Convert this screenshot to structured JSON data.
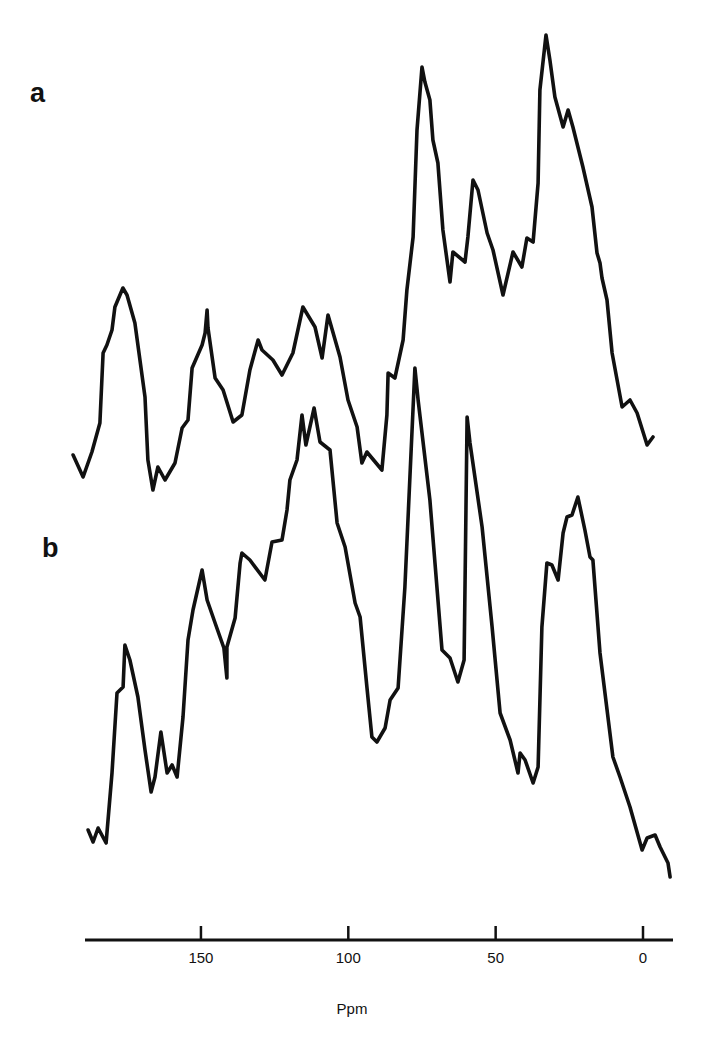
{
  "chart_data": {
    "type": "line",
    "title": "",
    "xlabel": "Ppm",
    "ylabel": "",
    "x_reversed": true,
    "xlim": [
      195,
      -10
    ],
    "xticks": [
      150,
      100,
      50,
      0
    ],
    "xtick_labels": [
      "150",
      "100",
      "50",
      "0"
    ],
    "grid": false,
    "legend": "none",
    "y_units": "relative intensity (arbitrary, pixel-scaled)",
    "series": [
      {
        "name": "a",
        "panel_label": "a",
        "baseline": 500,
        "points": [
          [
            193.4,
            45
          ],
          [
            190.0,
            23
          ],
          [
            187.0,
            48
          ],
          [
            184.3,
            77
          ],
          [
            183.2,
            147
          ],
          [
            181.9,
            155
          ],
          [
            180.2,
            170
          ],
          [
            179.2,
            193
          ],
          [
            176.5,
            212
          ],
          [
            175.1,
            205
          ],
          [
            172.4,
            177
          ],
          [
            169.0,
            103
          ],
          [
            168.0,
            40
          ],
          [
            166.3,
            10
          ],
          [
            164.6,
            33
          ],
          [
            162.2,
            20
          ],
          [
            158.8,
            37
          ],
          [
            156.4,
            72
          ],
          [
            154.4,
            80
          ],
          [
            153.0,
            132
          ],
          [
            149.6,
            155
          ],
          [
            148.6,
            167
          ],
          [
            147.9,
            190
          ],
          [
            147.6,
            172
          ],
          [
            145.2,
            122
          ],
          [
            142.5,
            110
          ],
          [
            139.1,
            78
          ],
          [
            136.1,
            85
          ],
          [
            133.4,
            130
          ],
          [
            130.6,
            160
          ],
          [
            129.3,
            150
          ],
          [
            125.6,
            140
          ],
          [
            122.5,
            125
          ],
          [
            118.8,
            147
          ],
          [
            115.4,
            193
          ],
          [
            111.3,
            173
          ],
          [
            108.9,
            142
          ],
          [
            106.9,
            185
          ],
          [
            102.8,
            143
          ],
          [
            100.1,
            100
          ],
          [
            97.0,
            73
          ],
          [
            95.4,
            37
          ],
          [
            93.7,
            48
          ],
          [
            88.6,
            30
          ],
          [
            86.9,
            85
          ],
          [
            86.5,
            127
          ],
          [
            84.2,
            122
          ],
          [
            81.4,
            160
          ],
          [
            80.1,
            210
          ],
          [
            78.0,
            263
          ],
          [
            76.7,
            370
          ],
          [
            75.0,
            433
          ],
          [
            74.0,
            418
          ],
          [
            72.3,
            400
          ],
          [
            71.3,
            360
          ],
          [
            69.6,
            337
          ],
          [
            67.9,
            270
          ],
          [
            65.5,
            218
          ],
          [
            64.5,
            248
          ],
          [
            60.4,
            238
          ],
          [
            59.4,
            263
          ],
          [
            57.7,
            320
          ],
          [
            56.0,
            310
          ],
          [
            52.9,
            267
          ],
          [
            50.9,
            250
          ],
          [
            47.5,
            205
          ],
          [
            44.1,
            248
          ],
          [
            41.1,
            233
          ],
          [
            39.4,
            262
          ],
          [
            37.3,
            258
          ],
          [
            35.6,
            317
          ],
          [
            35.0,
            410
          ],
          [
            32.9,
            465
          ],
          [
            31.6,
            440
          ],
          [
            29.9,
            403
          ],
          [
            27.1,
            373
          ],
          [
            25.4,
            390
          ],
          [
            23.8,
            373
          ],
          [
            20.4,
            333
          ],
          [
            17.3,
            293
          ],
          [
            15.6,
            247
          ],
          [
            14.6,
            237
          ],
          [
            13.9,
            222
          ],
          [
            12.2,
            200
          ],
          [
            10.5,
            147
          ],
          [
            7.1,
            93
          ],
          [
            4.4,
            100
          ],
          [
            2.0,
            87
          ],
          [
            -1.4,
            55
          ],
          [
            -3.4,
            63
          ]
        ]
      },
      {
        "name": "b",
        "panel_label": "b",
        "baseline": 880,
        "points": [
          [
            188.3,
            50
          ],
          [
            186.6,
            38
          ],
          [
            184.9,
            52
          ],
          [
            182.2,
            37
          ],
          [
            180.2,
            107
          ],
          [
            178.5,
            187
          ],
          [
            176.4,
            193
          ],
          [
            175.8,
            235
          ],
          [
            174.1,
            220
          ],
          [
            171.4,
            183
          ],
          [
            169.0,
            130
          ],
          [
            166.9,
            88
          ],
          [
            165.6,
            103
          ],
          [
            163.6,
            148
          ],
          [
            161.5,
            107
          ],
          [
            159.8,
            115
          ],
          [
            158.1,
            103
          ],
          [
            156.1,
            163
          ],
          [
            154.4,
            240
          ],
          [
            152.7,
            270
          ],
          [
            149.6,
            310
          ],
          [
            147.9,
            280
          ],
          [
            145.2,
            257
          ],
          [
            142.2,
            232
          ],
          [
            141.2,
            202
          ],
          [
            141.2,
            233
          ],
          [
            138.4,
            262
          ],
          [
            136.7,
            317
          ],
          [
            136.1,
            327
          ],
          [
            133.4,
            320
          ],
          [
            128.3,
            300
          ],
          [
            125.9,
            338
          ],
          [
            122.5,
            340
          ],
          [
            120.8,
            370
          ],
          [
            119.8,
            400
          ],
          [
            117.4,
            420
          ],
          [
            115.7,
            465
          ],
          [
            114.4,
            435
          ],
          [
            111.6,
            472
          ],
          [
            109.6,
            438
          ],
          [
            106.2,
            430
          ],
          [
            103.8,
            357
          ],
          [
            101.1,
            333
          ],
          [
            97.7,
            277
          ],
          [
            96.0,
            263
          ],
          [
            93.7,
            193
          ],
          [
            92.0,
            143
          ],
          [
            90.3,
            138
          ],
          [
            87.5,
            152
          ],
          [
            85.8,
            180
          ],
          [
            83.1,
            192
          ],
          [
            80.8,
            293
          ],
          [
            77.4,
            512
          ],
          [
            76.3,
            480
          ],
          [
            72.3,
            380
          ],
          [
            68.2,
            230
          ],
          [
            65.5,
            222
          ],
          [
            62.8,
            198
          ],
          [
            60.7,
            220
          ],
          [
            59.7,
            463
          ],
          [
            58.7,
            437
          ],
          [
            54.6,
            353
          ],
          [
            51.2,
            253
          ],
          [
            48.5,
            167
          ],
          [
            45.1,
            140
          ],
          [
            42.4,
            107
          ],
          [
            41.7,
            127
          ],
          [
            40.0,
            120
          ],
          [
            37.3,
            97
          ],
          [
            35.6,
            113
          ],
          [
            34.3,
            253
          ],
          [
            32.6,
            317
          ],
          [
            30.9,
            315
          ],
          [
            28.8,
            300
          ],
          [
            27.1,
            347
          ],
          [
            25.8,
            363
          ],
          [
            24.1,
            365
          ],
          [
            22.1,
            383
          ],
          [
            19.7,
            350
          ],
          [
            18.0,
            323
          ],
          [
            17.0,
            320
          ],
          [
            14.6,
            227
          ],
          [
            10.2,
            123
          ],
          [
            7.8,
            103
          ],
          [
            4.4,
            73
          ],
          [
            0.3,
            30
          ],
          [
            -1.4,
            42
          ],
          [
            -4.1,
            45
          ],
          [
            -5.8,
            33
          ],
          [
            -8.5,
            17
          ],
          [
            -9.2,
            3
          ]
        ]
      }
    ],
    "annotations": [
      "a",
      "b"
    ]
  },
  "layout": {
    "ppm_zero_px": 643,
    "px_per_ppm": 2.947,
    "axis_y_px": 940,
    "axis_x_start_px": 85,
    "axis_x_end_px": 673,
    "line_color": "#111111"
  }
}
